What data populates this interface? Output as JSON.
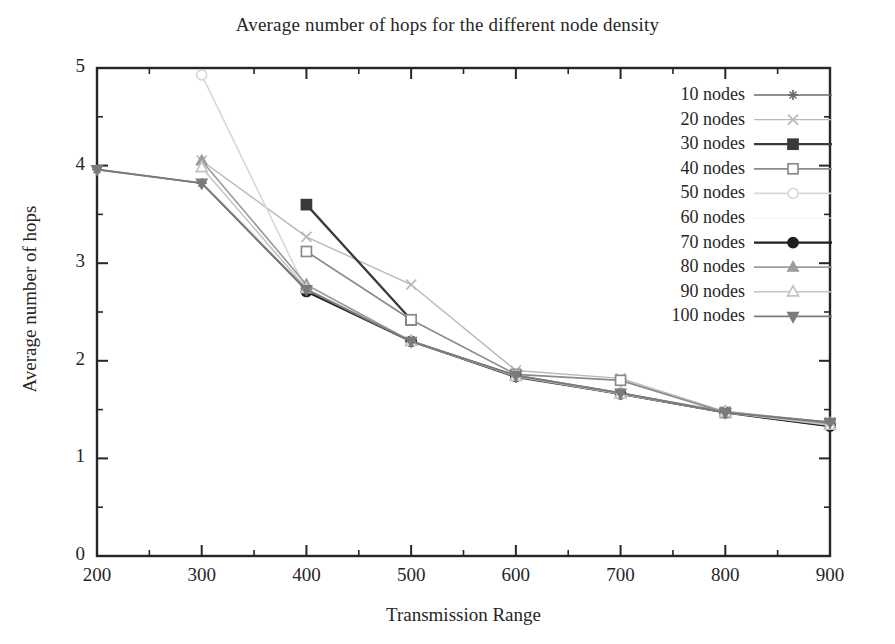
{
  "chart_data": {
    "type": "line",
    "title": "Average number of hops for the different node density",
    "xlabel": "Transmission Range",
    "ylabel": "Average number of hops",
    "xlim": [
      200,
      900
    ],
    "ylim": [
      0,
      5
    ],
    "xticks": [
      200,
      300,
      400,
      500,
      600,
      700,
      800,
      900
    ],
    "yticks": [
      0,
      1,
      2,
      3,
      4,
      5
    ],
    "xtick_labels": [
      "200",
      "300",
      "400",
      "500",
      "600",
      "700",
      "800",
      "900"
    ],
    "ytick_labels": [
      "0",
      "1",
      "2",
      "3",
      "4",
      "5"
    ],
    "grid": false,
    "legend_position": "top-right",
    "series": [
      {
        "name": "10 nodes",
        "color": "#6b6b6b",
        "marker": "plus-star",
        "linewidth": 1.6,
        "x": [
          200,
          300,
          400,
          500,
          600,
          700,
          800,
          900
        ],
        "y": [
          3.96,
          3.82,
          2.72,
          2.2,
          1.83,
          1.66,
          1.47,
          1.33
        ]
      },
      {
        "name": "20 nodes",
        "color": "#b9b9b9",
        "marker": "x-cross",
        "linewidth": 1.4,
        "x": [
          300,
          400,
          500,
          600,
          700,
          800,
          900
        ],
        "y": [
          4.05,
          3.27,
          2.78,
          1.9,
          1.82,
          1.48,
          1.37
        ]
      },
      {
        "name": "30 nodes",
        "color": "#3a3a3a",
        "marker": "filled-square",
        "linewidth": 2.3,
        "x": [
          400,
          500
        ],
        "y": [
          3.6,
          2.42
        ]
      },
      {
        "name": "40 nodes",
        "color": "#8a8a8a",
        "marker": "open-square",
        "linewidth": 1.7,
        "x": [
          400,
          500,
          600,
          700,
          800,
          900
        ],
        "y": [
          3.12,
          2.42,
          1.86,
          1.8,
          1.47,
          1.35
        ]
      },
      {
        "name": "50 nodes",
        "color": "#d8d8d8",
        "marker": "open-circle",
        "linewidth": 1.6,
        "x": [
          300,
          400,
          500,
          600,
          700,
          800,
          900
        ],
        "y": [
          4.93,
          2.72,
          2.2,
          1.85,
          1.67,
          1.47,
          1.34
        ]
      },
      {
        "name": "60 nodes",
        "color": "#f2f2f2",
        "marker": "none",
        "linewidth": 1.2,
        "x": [
          300,
          400,
          500,
          600,
          700,
          800,
          900
        ],
        "y": [
          3.84,
          2.78,
          2.21,
          1.84,
          1.67,
          1.46,
          1.33
        ]
      },
      {
        "name": "70 nodes",
        "color": "#1f1f1f",
        "marker": "filled-circle",
        "linewidth": 2.2,
        "x": [
          400,
          500,
          600,
          700,
          800,
          900
        ],
        "y": [
          2.71,
          2.2,
          1.84,
          1.66,
          1.47,
          1.33
        ]
      },
      {
        "name": "80 nodes",
        "color": "#9d9d9d",
        "marker": "filled-triangle-up",
        "linewidth": 1.7,
        "x": [
          300,
          400,
          500,
          600,
          700,
          800,
          900
        ],
        "y": [
          4.05,
          2.78,
          2.2,
          1.85,
          1.67,
          1.48,
          1.36
        ]
      },
      {
        "name": "90 nodes",
        "color": "#c4c4c4",
        "marker": "open-triangle-up",
        "linewidth": 1.5,
        "x": [
          300,
          400,
          500,
          600,
          700,
          800,
          900
        ],
        "y": [
          3.98,
          2.74,
          2.2,
          1.84,
          1.66,
          1.47,
          1.34
        ]
      },
      {
        "name": "100 nodes",
        "color": "#7a7a7a",
        "marker": "filled-triangle-down",
        "linewidth": 1.9,
        "x": [
          200,
          300,
          400,
          500,
          600,
          700,
          800,
          900
        ],
        "y": [
          3.96,
          3.82,
          2.73,
          2.2,
          1.85,
          1.67,
          1.47,
          1.37
        ]
      }
    ]
  },
  "axis": {
    "frame_color": "#262626"
  }
}
